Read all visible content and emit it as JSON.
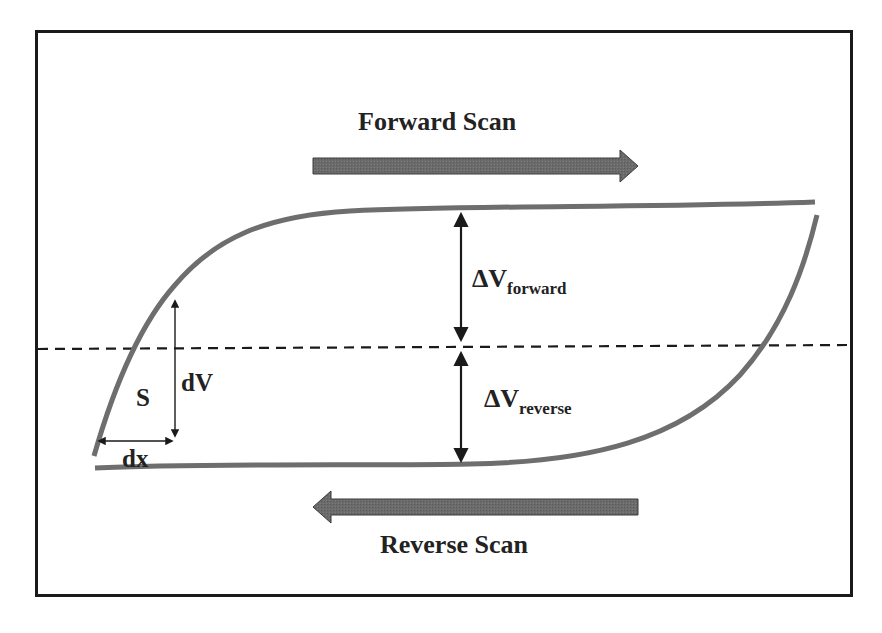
{
  "diagram": {
    "type": "hysteresis-loop-schematic",
    "colors": {
      "frame": "#1a1a1a",
      "curve": "#6e6e6e",
      "scan_arrow_fill": "#6b6b6b",
      "scan_arrow_stroke": "#3a3a3a",
      "dimension_arrow": "#1a1a1a",
      "dashed_line": "#1a1a1a",
      "text": "#222222",
      "background": "#ffffff"
    },
    "labels": {
      "forward_scan": "Forward Scan",
      "reverse_scan": "Reverse Scan",
      "delta_v_forward": {
        "symbol": "ΔV",
        "subscript": "forward"
      },
      "delta_v_reverse": {
        "symbol": "ΔV",
        "subscript": "reverse"
      },
      "slope": "S",
      "dv": "dV",
      "dx": "dx"
    },
    "elements": {
      "frame": {
        "x1": 35,
        "y1": 30,
        "x2": 853,
        "y2": 597
      },
      "zero_line": {
        "style": "dashed",
        "y_left": 349,
        "y_right": 345
      },
      "forward_arrow": {
        "direction": "right",
        "x_start": 313,
        "x_end": 638,
        "y": 166
      },
      "reverse_arrow": {
        "direction": "left",
        "x_start": 638,
        "x_end": 313,
        "y": 507
      },
      "upper_branch": "forward scan curve: rises steeply at left, saturates near top, flat to right edge",
      "lower_branch": "reverse scan curve: flat near bottom, rises steeply at right",
      "delta_v_forward_arrow": {
        "x": 461,
        "y_top": 212,
        "y_bottom": 341
      },
      "delta_v_reverse_arrow": {
        "x": 461,
        "y_top": 352,
        "y_bottom": 462
      },
      "dv_arrow": {
        "x": 175,
        "y_top": 298,
        "y_bottom": 438
      },
      "dx_arrow": {
        "y": 441,
        "x_left": 96,
        "x_right": 175
      }
    }
  }
}
